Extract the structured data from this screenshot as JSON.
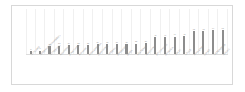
{
  "chart_data": {
    "type": "bar",
    "title": "",
    "subtitle": "",
    "xlabel": "",
    "ylabel": "",
    "grid": true,
    "legend_position": "none",
    "ylim": [
      0,
      100
    ],
    "categories": [
      "GOTLAND",
      "ÖREBRO/KOPPARBERG",
      "GÖTEBORG",
      "HALMSTAD",
      "JÖNKÖPING",
      "KALMAR",
      "KARLSKRONA",
      "LINKÖPING",
      "ÖREBRO",
      "SUNDSVALL",
      "UMEÅ",
      "VÄSTERÅS",
      "NYKÖPING",
      "STOCKHOLM",
      "UPPSALA",
      "VÄXJÖ",
      "GÄVLE",
      "KARLSTAD",
      "LULEÅ",
      "ÖSTERSUND",
      "MALMÖ"
    ],
    "values": [
      8,
      9,
      22,
      23,
      24,
      25,
      25,
      26,
      26,
      27,
      27,
      28,
      29,
      45,
      46,
      47,
      48,
      62,
      63,
      64,
      65
    ],
    "value_labels": [
      "8",
      "9",
      "22",
      "23",
      "24",
      "25",
      "25",
      "26",
      "26",
      "27",
      "27",
      "28",
      "29",
      "45",
      "46",
      "47",
      "48",
      "62",
      "63",
      "64",
      "65"
    ],
    "bar_color": "#8d8d8d",
    "gridline_color": "#f0f0f0",
    "axis_color": "#dcdcdc",
    "label_color": "#8f8f8f"
  }
}
